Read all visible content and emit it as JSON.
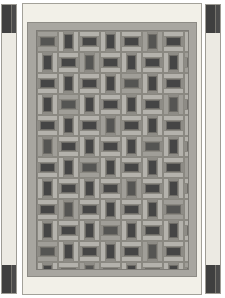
{
  "drawing": {
    "title": "Basketweave Tile Panel Elevation",
    "description": "Front elevation of a rectangular framed panel infilled with a basketweave tile pattern, flanked by two narrow vertical side strips.",
    "view": "front-elevation"
  },
  "canvas": {
    "width": 225,
    "height": 298,
    "background_color": "#ffffff"
  },
  "panel": {
    "name": "central-panel",
    "outer_frame_color": "#f2f0e8",
    "outer_frame_border_color": "#a3a199",
    "inner_frame_color": "#a8a6a0",
    "inner_frame_border_color": "#8d8b85",
    "field_background_color": "#8e8c86",
    "x": 22,
    "y": 3,
    "width": 180,
    "height": 292
  },
  "side_strips": [
    {
      "name": "left-side-strip",
      "position": "left",
      "fill_color": "#eceae3",
      "border_color": "#9e9c95",
      "x": 1,
      "y": 4,
      "width": 16,
      "height": 290,
      "end_blocks": [
        "top",
        "bottom"
      ],
      "end_block_color": "#4b4b4b"
    },
    {
      "name": "right-side-strip",
      "position": "right",
      "fill_color": "#eceae3",
      "border_color": "#9e9c95",
      "x": 205,
      "y": 4,
      "width": 16,
      "height": 290,
      "end_blocks": [
        "top",
        "bottom"
      ],
      "end_block_color": "#4b4b4b"
    }
  ],
  "tile_pattern": {
    "name": "basketweave",
    "type": "basketweave",
    "unit_size": 21,
    "columns": 7,
    "rows": 12,
    "square_color": "#454545",
    "square_color_alt": "#555553",
    "bar_color": "#b4b2ac",
    "bar_color_alt": "#a09e98",
    "joint_color": "#8a8881",
    "orientation_sequence": [
      "horizontal",
      "vertical"
    ]
  },
  "legend": {
    "dark_tile_label": "dark tile",
    "light_bar_label": "light bar",
    "frame_label": "frame",
    "strip_label": "side strip"
  }
}
